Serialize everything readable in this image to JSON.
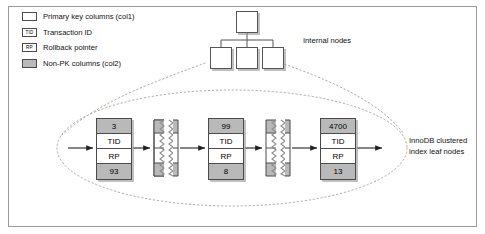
{
  "figure": {
    "border_color": "#9a9a9a",
    "background": "#ffffff",
    "shade_color": "#b9b9b9",
    "line_color": "#4a4a4a",
    "dotted_color": "#b0a9a0"
  },
  "legend": {
    "items": [
      {
        "icon": "empty-box-swatch",
        "tag": "",
        "label": "Primary key columns (col1)",
        "filled": false
      },
      {
        "icon": "tid-box-swatch",
        "tag": "TID",
        "label": "Transaction ID",
        "filled": false
      },
      {
        "icon": "rp-box-swatch",
        "tag": "RP",
        "label": "Rollback pointer",
        "filled": false
      },
      {
        "icon": "filled-box-swatch",
        "tag": "",
        "label": "Non-PK columns (col2)",
        "filled": true
      }
    ]
  },
  "tree": {
    "internal_nodes_label": "Internal nodes",
    "node_count": 4
  },
  "leaf": {
    "label": "InnoDB clustered index leaf nodes",
    "label_line_1": "InnoDB clustered",
    "label_line_2": "index leaf nodes",
    "records": [
      {
        "pk": "3",
        "tid": "TID",
        "rp": "RP",
        "nonpk": "93"
      },
      {
        "pk": "99",
        "tid": "TID",
        "rp": "RP",
        "nonpk": "8"
      },
      {
        "pk": "4700",
        "tid": "TID",
        "rp": "RP",
        "nonpk": "13"
      }
    ],
    "separator_count": 2
  }
}
